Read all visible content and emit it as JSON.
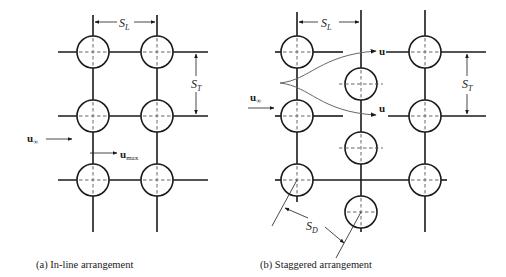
{
  "figure": {
    "panel_a": {
      "caption": "(a) In-line arrangement",
      "labels": {
        "SL": "S",
        "SL_sub": "L",
        "ST": "S",
        "ST_sub": "T",
        "u_inf": "u",
        "u_inf_sub": "∞",
        "u_max": "u",
        "u_max_sub": "max"
      }
    },
    "panel_b": {
      "caption": "(b) Staggered arrangement",
      "labels": {
        "SL": "S",
        "SL_sub": "L",
        "ST": "S",
        "ST_sub": "T",
        "SD": "S",
        "SD_sub": "D",
        "u_inf": "u",
        "u_inf_sub": "∞",
        "u_top": "u",
        "u_mid": "u"
      }
    }
  }
}
